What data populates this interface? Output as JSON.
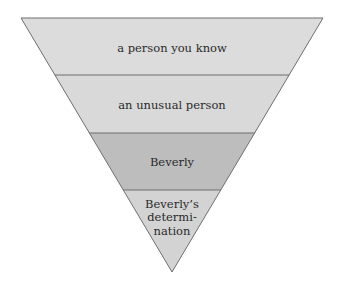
{
  "diagram": {
    "type": "inverted-pyramid",
    "levels": [
      {
        "label_lines": [
          "a person you know"
        ],
        "fill": "#dcdcdc"
      },
      {
        "label_lines": [
          "an unusual person"
        ],
        "fill": "#d9d9d9"
      },
      {
        "label_lines": [
          "Beverly"
        ],
        "fill": "#bdbdbd"
      },
      {
        "label_lines": [
          "Beverly’s",
          "determi-",
          "nation"
        ],
        "fill": "#d3d3d3"
      }
    ],
    "stroke": "#6e6e6e"
  }
}
